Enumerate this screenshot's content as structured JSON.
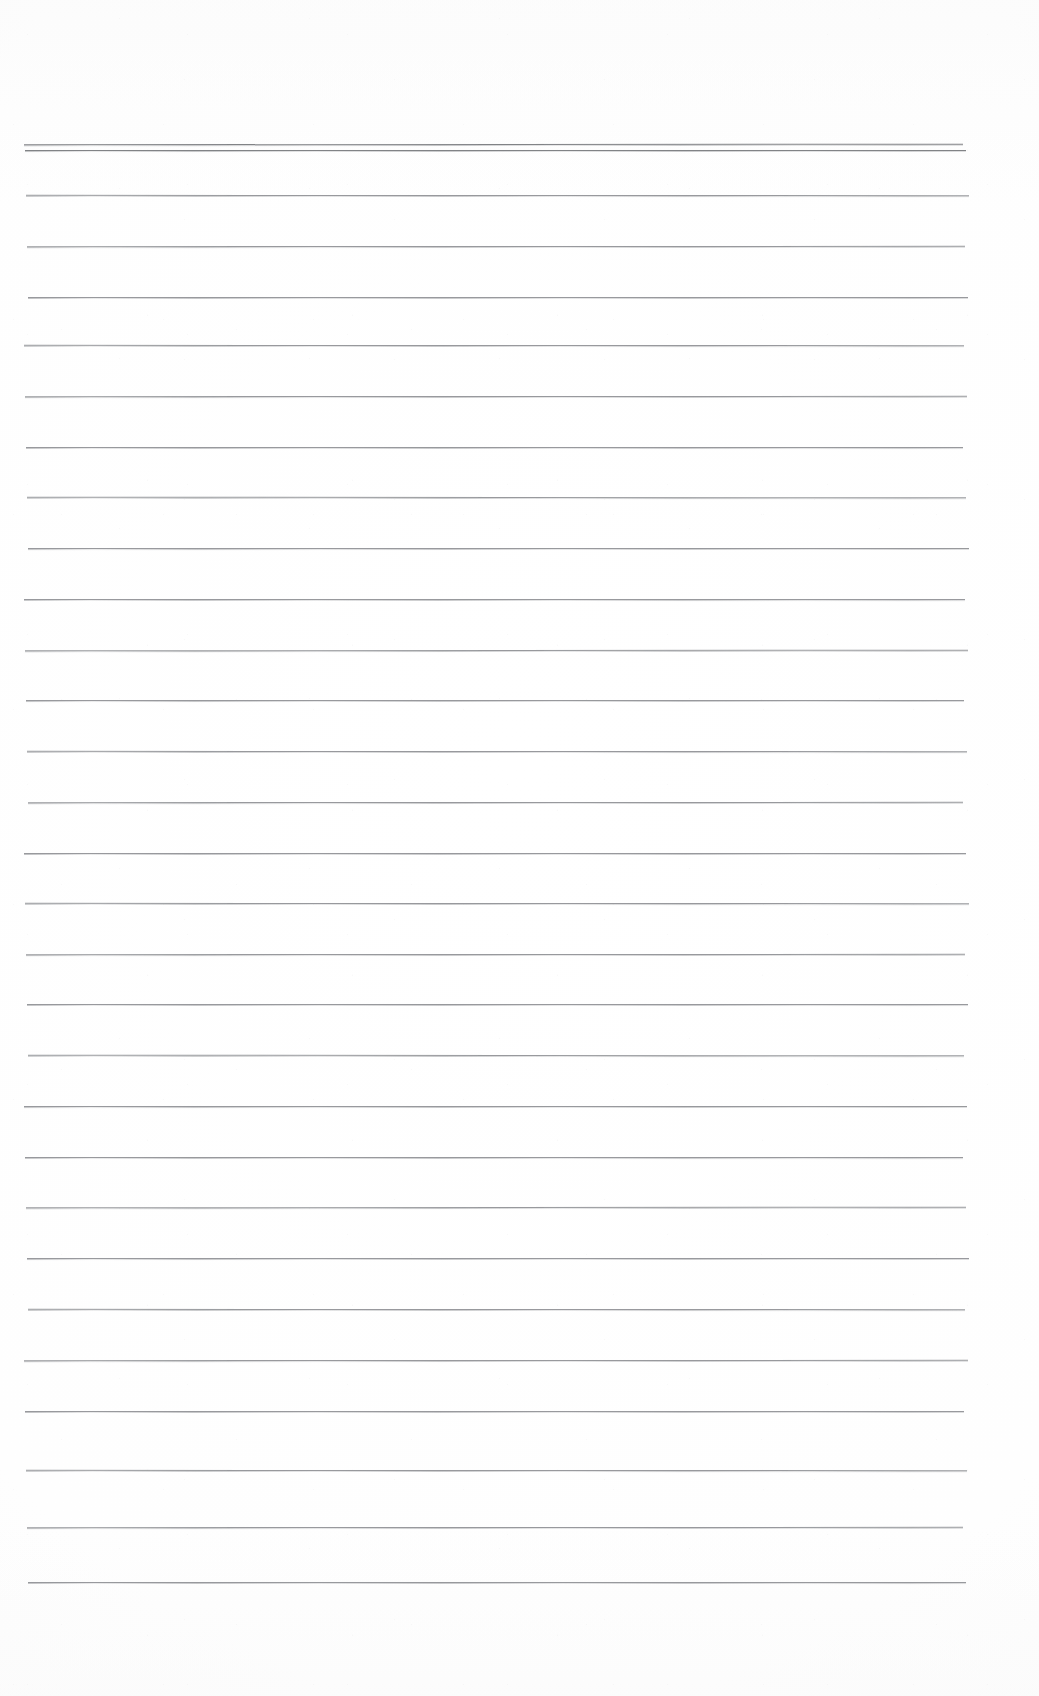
{
  "document": {
    "kind": "scanned-ruled-paper",
    "title": "",
    "body_text": "",
    "notes_written": "",
    "page_width": 1039,
    "page_height": 1696,
    "background_color": "#ffffff",
    "rule_color": "#8d8f93",
    "rule_color_heavy": "#74767a",
    "rule_thickness_px": 1,
    "rule_left_x": 26,
    "rule_right_x": 966,
    "rule_spacing_px": 51,
    "margins": {
      "top_blank_px": 144,
      "bottom_blank_px": 114,
      "left_px": 26,
      "right_px": 73
    },
    "rule_count": 29,
    "rules": [
      {
        "id": 1,
        "y": 144,
        "weight": "heavy"
      },
      {
        "id": 2,
        "y": 150,
        "weight": "heavy"
      },
      {
        "id": 3,
        "y": 195,
        "weight": "normal"
      },
      {
        "id": 4,
        "y": 246,
        "weight": "normal"
      },
      {
        "id": 5,
        "y": 297,
        "weight": "normal"
      },
      {
        "id": 6,
        "y": 345,
        "weight": "normal"
      },
      {
        "id": 7,
        "y": 396,
        "weight": "normal"
      },
      {
        "id": 8,
        "y": 447,
        "weight": "normal"
      },
      {
        "id": 9,
        "y": 497,
        "weight": "normal"
      },
      {
        "id": 10,
        "y": 548,
        "weight": "normal"
      },
      {
        "id": 11,
        "y": 599,
        "weight": "normal"
      },
      {
        "id": 12,
        "y": 650,
        "weight": "normal"
      },
      {
        "id": 13,
        "y": 700,
        "weight": "normal"
      },
      {
        "id": 14,
        "y": 751,
        "weight": "normal"
      },
      {
        "id": 15,
        "y": 802,
        "weight": "normal"
      },
      {
        "id": 16,
        "y": 853,
        "weight": "normal"
      },
      {
        "id": 17,
        "y": 903,
        "weight": "normal"
      },
      {
        "id": 18,
        "y": 954,
        "weight": "normal"
      },
      {
        "id": 19,
        "y": 1004,
        "weight": "normal"
      },
      {
        "id": 20,
        "y": 1055,
        "weight": "normal"
      },
      {
        "id": 21,
        "y": 1106,
        "weight": "normal"
      },
      {
        "id": 22,
        "y": 1157,
        "weight": "normal"
      },
      {
        "id": 23,
        "y": 1207,
        "weight": "normal"
      },
      {
        "id": 24,
        "y": 1258,
        "weight": "normal"
      },
      {
        "id": 25,
        "y": 1309,
        "weight": "normal"
      },
      {
        "id": 26,
        "y": 1360,
        "weight": "normal"
      },
      {
        "id": 27,
        "y": 1411,
        "weight": "normal"
      },
      {
        "id": 28,
        "y": 1470,
        "weight": "normal"
      },
      {
        "id": 29,
        "y": 1527,
        "weight": "normal"
      },
      {
        "id": 30,
        "y": 1582,
        "weight": "normal"
      }
    ]
  }
}
